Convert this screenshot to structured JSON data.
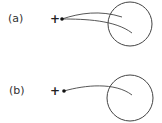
{
  "panels": [
    {
      "id": "a",
      "label": "(a)",
      "charge_symbol": "+",
      "particle": {
        "x": 62,
        "y": 19
      },
      "target_circle": {
        "cx": 130,
        "cy": 24,
        "r": 22
      },
      "trajectories": [
        {
          "path": "M62,19 C80,13 100,10 122,17"
        },
        {
          "path": "M62,19 C85,19 115,20 132,33"
        }
      ]
    },
    {
      "id": "b",
      "label": "(b)",
      "charge_symbol": "+",
      "particle": {
        "x": 64,
        "y": 91
      },
      "target_circle": {
        "cx": 130,
        "cy": 98,
        "r": 23
      },
      "trajectories": [
        {
          "path": "M64,91 C85,85 115,82 132,95"
        }
      ]
    }
  ],
  "colors": {
    "stroke": "#444444",
    "particle": "#111111",
    "text": "#333333"
  }
}
